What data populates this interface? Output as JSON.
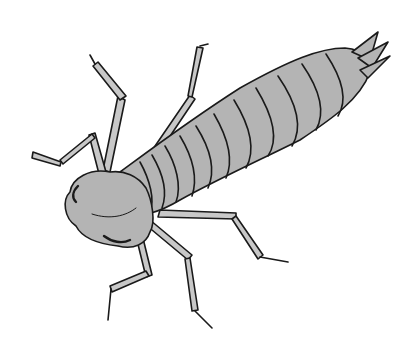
{
  "image": {
    "subject": "Aquatic insect nymph line illustration",
    "colors": {
      "background": "#ffffff",
      "body_fill": "#b4b4b4",
      "outline": "#1a1a1a"
    },
    "abdomen_segments": 11,
    "legs": 6
  }
}
